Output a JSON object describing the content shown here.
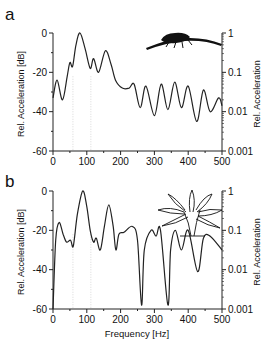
{
  "figure": {
    "xlabel": "Frequency [Hz]",
    "ylabel_left": "Rel. Acceleration [dB]",
    "ylabel_right": "Rel. Acceleration"
  },
  "chart_data": [
    {
      "type": "line",
      "panel_label": "a",
      "title": "",
      "inset_illustration": "insect-on-leaf",
      "xlabel": "",
      "ylabel": "Rel. Acceleration [dB]",
      "ylabel_right": "Rel. Acceleration",
      "xlim": [
        0,
        500
      ],
      "ylim": [
        -60,
        0
      ],
      "x_ticks": [
        "0",
        "100",
        "200",
        "300",
        "400",
        "500"
      ],
      "y_ticks": [
        "0",
        "-20",
        "-40",
        "-60"
      ],
      "y_ticks_right": [
        "1",
        "0.1",
        "0.01",
        "0.001"
      ],
      "reference_lines_hz": [
        59,
        112
      ],
      "grid": false,
      "x": [
        0,
        12,
        28,
        42,
        50,
        58,
        68,
        80,
        95,
        110,
        120,
        135,
        155,
        172,
        185,
        205,
        225,
        240,
        258,
        275,
        300,
        320,
        340,
        360,
        380,
        400,
        425,
        445,
        465,
        490,
        500
      ],
      "values": [
        -33,
        -24,
        -34,
        -22,
        -15,
        -17,
        -6,
        0,
        -8,
        -18,
        -13,
        -20,
        -9,
        -16,
        -24,
        -28,
        -28,
        -26,
        -38,
        -27,
        -42,
        -26,
        -39,
        -25,
        -38,
        -27,
        -45,
        -29,
        -40,
        -33,
        -37
      ]
    },
    {
      "type": "line",
      "panel_label": "b",
      "title": "",
      "inset_illustration": "plant",
      "xlabel": "Frequency [Hz]",
      "ylabel": "Rel. Acceleration [dB]",
      "ylabel_right": "Rel. Acceleration",
      "xlim": [
        0,
        500
      ],
      "ylim": [
        -60,
        0
      ],
      "x_ticks": [
        "0",
        "100",
        "200",
        "300",
        "400",
        "500"
      ],
      "y_ticks": [
        "0",
        "-20",
        "-40",
        "-60"
      ],
      "y_ticks_right": [
        "1",
        "0.1",
        "0.01",
        "0.001"
      ],
      "reference_lines_hz": [
        59,
        112
      ],
      "grid": false,
      "x": [
        0,
        8,
        18,
        30,
        40,
        52,
        60,
        72,
        88,
        100,
        110,
        120,
        128,
        140,
        152,
        165,
        178,
        186,
        195,
        210,
        235,
        250,
        262,
        270,
        290,
        305,
        318,
        340,
        348,
        362,
        380,
        400,
        428,
        445,
        465,
        500
      ],
      "values": [
        -60,
        -25,
        -16,
        -22,
        -26,
        -25,
        -28,
        -12,
        0,
        -8,
        -20,
        -26,
        -24,
        -30,
        -18,
        -7,
        -18,
        -30,
        -22,
        -21,
        -18,
        -25,
        -58,
        -30,
        -20,
        -23,
        -20,
        -58,
        -30,
        -20,
        -30,
        -20,
        -41,
        -24,
        -23,
        -30
      ]
    }
  ]
}
